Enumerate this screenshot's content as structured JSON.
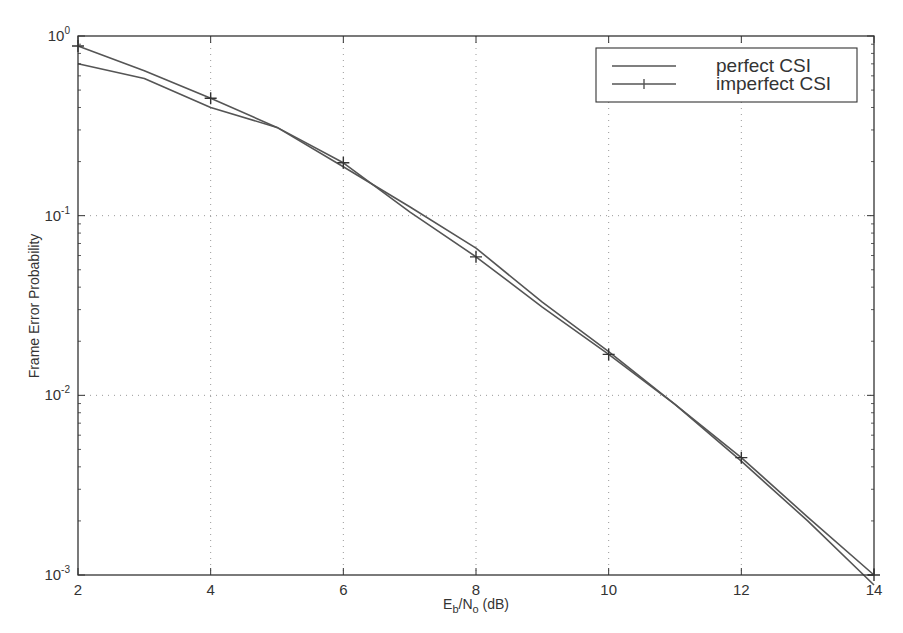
{
  "chart_data": {
    "type": "line",
    "title": "",
    "xlabel": "E_b/N_o (dB)",
    "xlabel_parts": {
      "E": "E",
      "b": "b",
      "slash": "/N",
      "o": "o",
      "unit": " (dB)"
    },
    "ylabel": "Frame Error Probability",
    "xscale": "linear",
    "yscale": "log",
    "xlim": [
      2,
      14
    ],
    "ylim": [
      0.001,
      1
    ],
    "x_ticks": [
      2,
      4,
      6,
      8,
      10,
      12,
      14
    ],
    "x_tick_labels": [
      "2",
      "4",
      "6",
      "8",
      "10",
      "12",
      "14"
    ],
    "y_ticks": [
      1,
      0.1,
      0.01,
      0.001
    ],
    "y_tick_labels": [
      {
        "base": "10",
        "exp": "0"
      },
      {
        "base": "10",
        "exp": "-1"
      },
      {
        "base": "10",
        "exp": "-2"
      },
      {
        "base": "10",
        "exp": "-3"
      }
    ],
    "grid": true,
    "grid_style": "dotted",
    "legend_position": "upper right",
    "series": [
      {
        "name": "perfect CSI",
        "marker": "none",
        "x": [
          2,
          3,
          4,
          5,
          6,
          7,
          8,
          9,
          10,
          11,
          12,
          13,
          14
        ],
        "values": [
          0.7,
          0.58,
          0.4,
          0.31,
          0.187,
          0.112,
          0.066,
          0.033,
          0.0175,
          0.0089,
          0.0043,
          0.002,
          0.00088
        ]
      },
      {
        "name": "imperfect CSI",
        "marker": "+",
        "marker_x": [
          2,
          4,
          6,
          8,
          10,
          12,
          14
        ],
        "x": [
          2,
          3,
          4,
          5,
          6,
          7,
          8,
          9,
          10,
          11,
          12,
          13,
          14
        ],
        "values": [
          0.88,
          0.64,
          0.45,
          0.31,
          0.197,
          0.105,
          0.059,
          0.031,
          0.0169,
          0.0089,
          0.0045,
          0.0021,
          0.001
        ]
      }
    ]
  },
  "style": {
    "line_color": "#555555",
    "axis_color": "#333333",
    "grid_color": "#999999",
    "background": "#ffffff"
  }
}
